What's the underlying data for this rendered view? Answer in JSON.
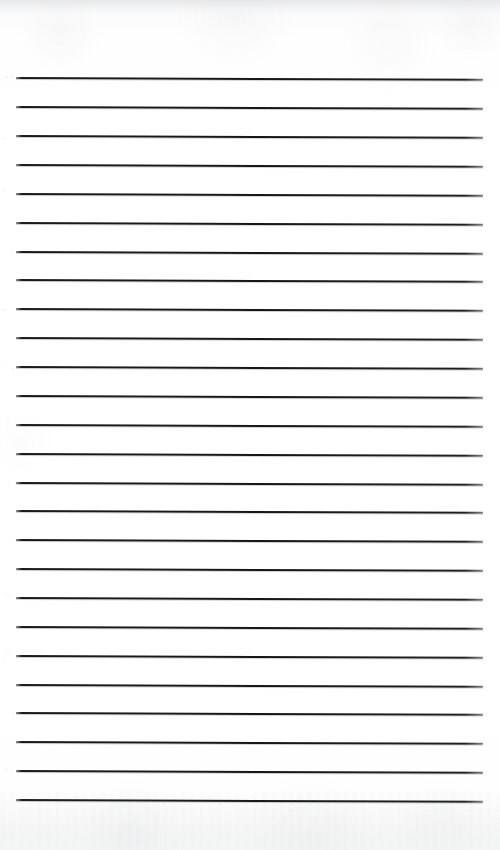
{
  "document": {
    "kind": "scanned-lined-paper",
    "title": "Blank ruled notepad page",
    "orientation": "portrait",
    "page_width": 500,
    "page_height": 850,
    "paper_color": "#fefefe",
    "rule_color": "#1a1b1d",
    "has_handwriting": false,
    "has_text": false,
    "has_margin_rule": false,
    "has_header": false,
    "has_footer": false,
    "visible_text": ""
  },
  "rules": {
    "count": 26,
    "line_thickness_px": 2,
    "spacing_px": 28.9,
    "first_line_y": 78,
    "last_line_y": 800,
    "left_x": 16,
    "right_x": 483,
    "skew_degrees": 0.22,
    "positions_y": [
      78,
      107,
      136,
      165,
      194,
      223,
      252,
      280,
      309,
      338,
      367,
      396,
      425,
      454,
      483,
      511,
      540,
      569,
      598,
      627,
      656,
      685,
      713,
      742,
      771,
      800
    ]
  },
  "margins": {
    "top_px": 78,
    "bottom_px": 50,
    "left_px": 16,
    "right_px": 17
  },
  "texture": {
    "top_edge_band": "light-grey scan edge",
    "bottom_edge_band": "faint speckled scan noise",
    "left_margin_flecks": "sparse grey dots"
  }
}
